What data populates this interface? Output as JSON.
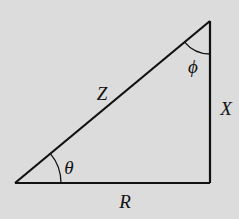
{
  "diagram": {
    "type": "right-triangle",
    "background": "#dcdcdc",
    "stroke_color": "#111111",
    "vertices": {
      "bottom_left": [
        15,
        183
      ],
      "bottom_right": [
        210,
        183
      ],
      "top_right": [
        210,
        21
      ]
    },
    "sides": {
      "hypotenuse": {
        "label": "Z",
        "pos": [
          102,
          93
        ]
      },
      "vertical": {
        "label": "X",
        "pos": [
          226,
          108
        ]
      },
      "horizontal": {
        "label": "R",
        "pos": [
          125,
          201
        ]
      }
    },
    "angles": {
      "bottom_left": {
        "label": "θ",
        "pos": [
          69,
          167
        ]
      },
      "top": {
        "label": "ϕ",
        "pos": [
          193,
          66
        ]
      }
    }
  }
}
